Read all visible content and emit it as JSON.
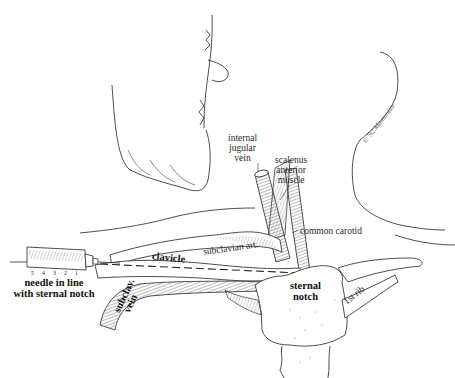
{
  "figure": {
    "type": "anatomical illustration",
    "labels": {
      "internal_jugular_vein": [
        "internal",
        "jugular",
        "vein"
      ],
      "scalenus_anterior_muscle": [
        "scalenus",
        "anterior",
        "muscle"
      ],
      "common_carotid": "common carotid",
      "subclavian_artery": "subclavian art.",
      "clavicle": "clavicle",
      "subclavian_vein": [
        "subclav.",
        "vein"
      ],
      "sternal_notch": [
        "sternal",
        "notch"
      ],
      "first_rib": "1st rib",
      "needle_instruction": [
        "needle in line",
        "with sternal notch"
      ]
    },
    "syringe_scale": [
      "5",
      "4",
      "3",
      "2",
      "1"
    ],
    "signature": "© '92 Mamunian"
  },
  "colors": {
    "line": "#3a3a3a",
    "hatch": "#555555",
    "background": "#ffffff"
  }
}
